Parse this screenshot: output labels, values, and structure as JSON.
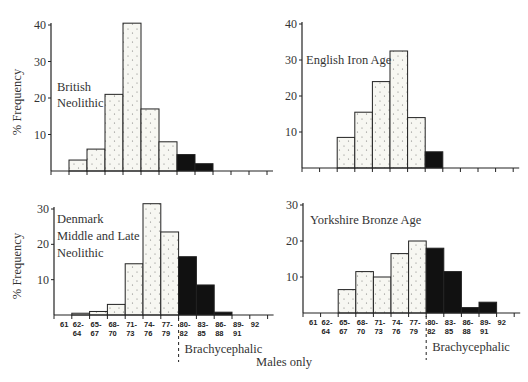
{
  "chart_data": [
    {
      "type": "bar",
      "title": "British Neolithic",
      "ylabel": "% Frequency",
      "xlabel": "",
      "ylim": [
        0,
        40
      ],
      "yticks": [
        10,
        20,
        30,
        40
      ],
      "categories": [
        "61",
        "62-64",
        "65-67",
        "68-70",
        "71-73",
        "74-76",
        "77-79",
        "80-82",
        "83-85",
        "86-88",
        "89-91",
        "92"
      ],
      "values": [
        0,
        3,
        6,
        21,
        40.5,
        17,
        8,
        4.5,
        2,
        0,
        0,
        0
      ],
      "brachycephalic_from": "80-82"
    },
    {
      "type": "bar",
      "title": "English Iron Age",
      "ylabel": "",
      "xlabel": "",
      "ylim": [
        0,
        40
      ],
      "yticks": [
        10,
        20,
        30,
        40
      ],
      "categories": [
        "61",
        "62-64",
        "65-67",
        "68-70",
        "71-73",
        "74-76",
        "77-79",
        "80-82",
        "83-85",
        "86-88",
        "89-91",
        "92"
      ],
      "values": [
        0,
        0,
        8.5,
        15.5,
        24,
        32.5,
        14,
        4.5,
        0,
        0,
        0,
        0
      ],
      "brachycephalic_from": "80-82"
    },
    {
      "type": "bar",
      "title": "Denmark Middle and Late Neolithic",
      "ylabel": "% Frequency",
      "xlabel": "",
      "ylim": [
        0,
        30
      ],
      "yticks": [
        10,
        20,
        30
      ],
      "categories": [
        "61",
        "62-64",
        "65-67",
        "68-70",
        "71-73",
        "74-76",
        "77-79",
        "80-82",
        "83-85",
        "86-88",
        "89-91",
        "92"
      ],
      "values": [
        0,
        0.5,
        1,
        3,
        14.5,
        31.5,
        23.5,
        16.5,
        8.5,
        0.8,
        0,
        0
      ],
      "brachycephalic_from": "80-82"
    },
    {
      "type": "bar",
      "title": "Yorkshire Bronze Age",
      "ylabel": "",
      "xlabel": "",
      "ylim": [
        0,
        30
      ],
      "yticks": [
        10,
        20,
        30
      ],
      "categories": [
        "61",
        "62-64",
        "65-67",
        "68-70",
        "71-73",
        "74-76",
        "77-79",
        "80-82",
        "83-85",
        "86-88",
        "89-91",
        "92"
      ],
      "values": [
        0,
        0,
        6.5,
        11.5,
        10,
        16.5,
        20,
        18,
        11.5,
        1.5,
        3,
        0
      ],
      "brachycephalic_from": "80-82"
    }
  ],
  "labels": {
    "ylabel": "% Frequency",
    "brachycephalic": "Brachycephalic",
    "footer": "Males only",
    "panel_titles": [
      [
        "British",
        "Neolithic"
      ],
      [
        "English Iron Age"
      ],
      [
        "Denmark",
        "Middle and Late",
        "Neolithic"
      ],
      [
        "Yorkshire Bronze Age"
      ]
    ],
    "bin_labels": [
      [
        "61"
      ],
      [
        "62-",
        "64"
      ],
      [
        "65-",
        "67"
      ],
      [
        "68-",
        "70"
      ],
      [
        "71-",
        "73"
      ],
      [
        "74-",
        "76"
      ],
      [
        "77-",
        "79"
      ],
      [
        "80-",
        "82"
      ],
      [
        "83-",
        "85"
      ],
      [
        "86-",
        "88"
      ],
      [
        "89-",
        "91"
      ],
      [
        "92"
      ]
    ]
  },
  "colors": {
    "dolicho_fill": "#f7f7f2",
    "brachy_fill": "#111111",
    "line": "#222222",
    "dots": "#777777"
  }
}
